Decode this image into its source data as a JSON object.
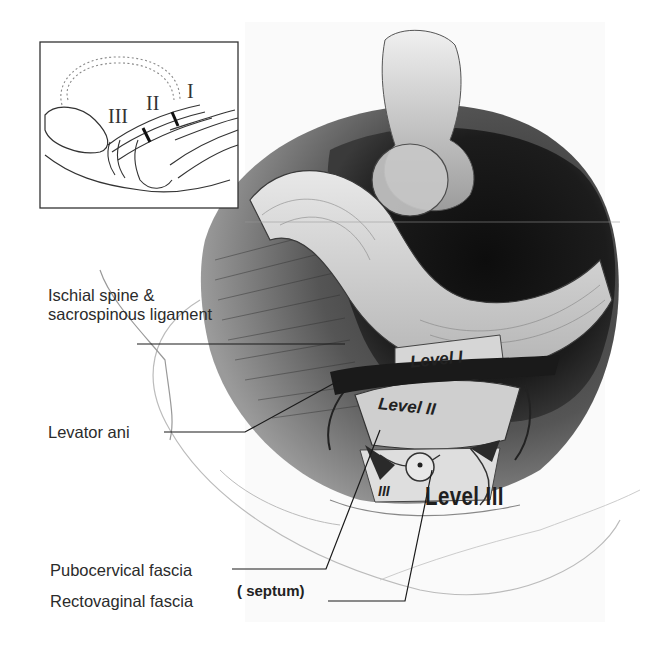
{
  "figure": {
    "inset": {
      "roman_labels": [
        "III",
        "II",
        "I"
      ]
    },
    "band_labels": {
      "level_1": "Level I",
      "level_2": "Level II",
      "level_3_small": "III"
    },
    "main_label_level_3": "Level III",
    "callouts": {
      "ischial_spine": "Ischial spine & sacrospinous ligament",
      "levator_ani": "Levator ani",
      "pubocervical": "Pubocervical fascia",
      "rectovaginal": "Rectovaginal fascia",
      "septum": "( septum)"
    },
    "colors": {
      "background": "#ffffff",
      "ink": "#222222",
      "dark_tissue": "#1a1a1a",
      "mid_tissue": "#6e6e6e",
      "light_tissue": "#d9d9d9"
    }
  }
}
